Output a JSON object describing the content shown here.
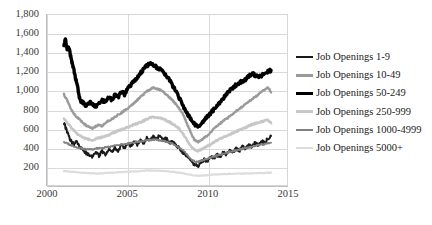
{
  "chart_data": {
    "type": "line",
    "title": "",
    "xlabel": "",
    "ylabel": "",
    "xlim": [
      2000,
      2015
    ],
    "ylim": [
      0,
      1800
    ],
    "ytick_labels": [
      "1,800",
      "1,600",
      "1,400",
      "1,200",
      "1,000",
      "800",
      "600",
      "400",
      "200",
      "-"
    ],
    "ytick_values": [
      1800,
      1600,
      1400,
      1200,
      1000,
      800,
      600,
      400,
      200,
      0
    ],
    "xtick_labels": [
      "2000",
      "2005",
      "2010",
      "2015"
    ],
    "xtick_values": [
      2000,
      2005,
      2010,
      2015
    ],
    "grid": "horizontal-and-vertical",
    "legend_position": "right",
    "series": [
      {
        "name": "Job Openings 1-9",
        "color": "#1a1a1a",
        "width": 2.0,
        "x": [
          2001.0,
          2001.2,
          2001.4,
          2001.6,
          2001.8,
          2002.0,
          2002.2,
          2002.4,
          2002.6,
          2002.8,
          2003.0,
          2003.2,
          2003.4,
          2003.6,
          2003.8,
          2004.0,
          2004.2,
          2004.4,
          2004.6,
          2004.8,
          2005.0,
          2005.2,
          2005.4,
          2005.6,
          2005.8,
          2006.0,
          2006.2,
          2006.4,
          2006.6,
          2006.8,
          2007.0,
          2007.2,
          2007.4,
          2007.6,
          2007.8,
          2008.0,
          2008.2,
          2008.4,
          2008.6,
          2008.8,
          2009.0,
          2009.2,
          2009.4,
          2009.6,
          2009.8,
          2010.0,
          2010.2,
          2010.4,
          2010.6,
          2010.8,
          2011.0,
          2011.2,
          2011.4,
          2011.6,
          2011.8,
          2012.0,
          2012.2,
          2012.4,
          2012.6,
          2012.8,
          2013.0,
          2013.2,
          2013.4,
          2013.6,
          2013.8,
          2014.0
        ],
        "values": [
          660,
          560,
          480,
          430,
          455,
          400,
          370,
          335,
          320,
          300,
          345,
          310,
          355,
          325,
          380,
          350,
          395,
          360,
          420,
          390,
          445,
          410,
          455,
          430,
          480,
          445,
          495,
          470,
          510,
          480,
          530,
          470,
          500,
          440,
          465,
          420,
          400,
          355,
          330,
          290,
          250,
          215,
          200,
          235,
          270,
          250,
          300,
          280,
          320,
          300,
          345,
          320,
          370,
          340,
          395,
          360,
          405,
          380,
          430,
          400,
          450,
          420,
          470,
          440,
          495,
          520
        ]
      },
      {
        "name": "Job Openings 10-49",
        "color": "#9a9a9a",
        "width": 2.4,
        "x": [
          2001.0,
          2001.2,
          2001.4,
          2001.6,
          2001.8,
          2002.0,
          2002.2,
          2002.4,
          2002.6,
          2002.8,
          2003.0,
          2003.2,
          2003.4,
          2003.6,
          2003.8,
          2004.0,
          2004.2,
          2004.4,
          2004.6,
          2004.8,
          2005.0,
          2005.2,
          2005.4,
          2005.6,
          2005.8,
          2006.0,
          2006.2,
          2006.4,
          2006.6,
          2006.8,
          2007.0,
          2007.2,
          2007.4,
          2007.6,
          2007.8,
          2008.0,
          2008.2,
          2008.4,
          2008.6,
          2008.8,
          2009.0,
          2009.2,
          2009.4,
          2009.6,
          2009.8,
          2010.0,
          2010.2,
          2010.4,
          2010.6,
          2010.8,
          2011.0,
          2011.2,
          2011.4,
          2011.6,
          2011.8,
          2012.0,
          2012.2,
          2012.4,
          2012.6,
          2012.8,
          2013.0,
          2013.2,
          2013.4,
          2013.6,
          2013.8,
          2014.0
        ],
        "values": [
          960,
          900,
          820,
          760,
          720,
          690,
          655,
          630,
          610,
          600,
          620,
          640,
          625,
          660,
          680,
          700,
          720,
          745,
          760,
          790,
          810,
          840,
          870,
          900,
          930,
          960,
          990,
          1010,
          1030,
          1020,
          1010,
          990,
          960,
          930,
          900,
          860,
          820,
          770,
          700,
          620,
          540,
          480,
          455,
          470,
          500,
          520,
          560,
          590,
          620,
          650,
          680,
          700,
          730,
          750,
          780,
          810,
          830,
          860,
          880,
          910,
          930,
          960,
          990,
          1010,
          1040,
          980
        ]
      },
      {
        "name": "Job Openings 50-249",
        "color": "#000000",
        "width": 3.4,
        "x": [
          2001.0,
          2001.1,
          2001.2,
          2001.3,
          2001.4,
          2001.5,
          2001.6,
          2001.7,
          2001.8,
          2001.9,
          2002.0,
          2002.2,
          2002.4,
          2002.6,
          2002.8,
          2003.0,
          2003.2,
          2003.4,
          2003.6,
          2003.8,
          2004.0,
          2004.2,
          2004.4,
          2004.6,
          2004.8,
          2005.0,
          2005.2,
          2005.4,
          2005.6,
          2005.8,
          2006.0,
          2006.2,
          2006.4,
          2006.6,
          2006.8,
          2007.0,
          2007.2,
          2007.4,
          2007.6,
          2007.8,
          2008.0,
          2008.2,
          2008.4,
          2008.6,
          2008.8,
          2009.0,
          2009.2,
          2009.4,
          2009.6,
          2009.8,
          2010.0,
          2010.2,
          2010.4,
          2010.6,
          2010.8,
          2011.0,
          2011.2,
          2011.4,
          2011.6,
          2011.8,
          2012.0,
          2012.2,
          2012.4,
          2012.6,
          2012.8,
          2013.0,
          2013.2,
          2013.4,
          2013.6,
          2013.8,
          2014.0
        ],
        "values": [
          1480,
          1550,
          1420,
          1460,
          1380,
          1300,
          1240,
          1150,
          1080,
          1000,
          900,
          870,
          840,
          880,
          860,
          830,
          870,
          900,
          870,
          930,
          900,
          950,
          930,
          990,
          960,
          1020,
          1060,
          1100,
          1140,
          1180,
          1230,
          1260,
          1290,
          1270,
          1250,
          1230,
          1200,
          1160,
          1120,
          1060,
          1000,
          930,
          870,
          800,
          740,
          690,
          640,
          620,
          650,
          690,
          720,
          760,
          800,
          840,
          880,
          920,
          960,
          1000,
          1030,
          1060,
          1080,
          1100,
          1120,
          1150,
          1180,
          1160,
          1140,
          1160,
          1180,
          1200,
          1215
        ]
      },
      {
        "name": "Job Openings 250-999",
        "color": "#c7c7c7",
        "width": 2.6,
        "x": [
          2001.0,
          2001.2,
          2001.4,
          2001.6,
          2001.8,
          2002.0,
          2002.2,
          2002.4,
          2002.6,
          2002.8,
          2003.0,
          2003.2,
          2003.4,
          2003.6,
          2003.8,
          2004.0,
          2004.2,
          2004.4,
          2004.6,
          2004.8,
          2005.0,
          2005.2,
          2005.4,
          2005.6,
          2005.8,
          2006.0,
          2006.2,
          2006.4,
          2006.6,
          2006.8,
          2007.0,
          2007.2,
          2007.4,
          2007.6,
          2007.8,
          2008.0,
          2008.2,
          2008.4,
          2008.6,
          2008.8,
          2009.0,
          2009.2,
          2009.4,
          2009.6,
          2009.8,
          2010.0,
          2010.2,
          2010.4,
          2010.6,
          2010.8,
          2011.0,
          2011.2,
          2011.4,
          2011.6,
          2011.8,
          2012.0,
          2012.2,
          2012.4,
          2012.6,
          2012.8,
          2013.0,
          2013.2,
          2013.4,
          2013.6,
          2013.8,
          2014.0
        ],
        "values": [
          700,
          660,
          620,
          580,
          545,
          520,
          500,
          490,
          480,
          475,
          490,
          500,
          505,
          520,
          530,
          545,
          560,
          575,
          585,
          600,
          610,
          625,
          640,
          650,
          665,
          680,
          700,
          710,
          720,
          715,
          710,
          700,
          685,
          670,
          650,
          625,
          600,
          560,
          510,
          450,
          400,
          370,
          360,
          375,
          395,
          410,
          430,
          450,
          470,
          490,
          505,
          520,
          535,
          550,
          565,
          580,
          595,
          610,
          625,
          640,
          650,
          660,
          670,
          680,
          690,
          655
        ]
      },
      {
        "name": "Job Openings 1000-4999",
        "color": "#808080",
        "width": 1.8,
        "x": [
          2001.0,
          2001.2,
          2001.4,
          2001.6,
          2001.8,
          2002.0,
          2002.2,
          2002.4,
          2002.6,
          2002.8,
          2003.0,
          2003.2,
          2003.4,
          2003.6,
          2003.8,
          2004.0,
          2004.2,
          2004.4,
          2004.6,
          2004.8,
          2005.0,
          2005.2,
          2005.4,
          2005.6,
          2005.8,
          2006.0,
          2006.2,
          2006.4,
          2006.6,
          2006.8,
          2007.0,
          2007.2,
          2007.4,
          2007.6,
          2007.8,
          2008.0,
          2008.2,
          2008.4,
          2008.6,
          2008.8,
          2009.0,
          2009.2,
          2009.4,
          2009.6,
          2009.8,
          2010.0,
          2010.2,
          2010.4,
          2010.6,
          2010.8,
          2011.0,
          2011.2,
          2011.4,
          2011.6,
          2011.8,
          2012.0,
          2012.2,
          2012.4,
          2012.6,
          2012.8,
          2013.0,
          2013.2,
          2013.4,
          2013.6,
          2013.8,
          2014.0
        ],
        "values": [
          455,
          440,
          425,
          410,
          400,
          390,
          385,
          380,
          378,
          375,
          385,
          390,
          392,
          398,
          402,
          408,
          415,
          420,
          425,
          432,
          438,
          445,
          452,
          458,
          462,
          468,
          474,
          478,
          480,
          478,
          474,
          468,
          460,
          450,
          438,
          420,
          400,
          375,
          345,
          310,
          270,
          250,
          245,
          255,
          268,
          278,
          290,
          300,
          312,
          322,
          332,
          342,
          350,
          358,
          366,
          374,
          382,
          390,
          398,
          406,
          414,
          422,
          428,
          434,
          440,
          448
        ]
      },
      {
        "name": "Job Openings 5000+",
        "color": "#dcdcdc",
        "width": 2.2,
        "x": [
          2001.0,
          2001.4,
          2001.8,
          2002.2,
          2002.6,
          2003.0,
          2003.4,
          2003.8,
          2004.2,
          2004.6,
          2005.0,
          2005.4,
          2005.8,
          2006.2,
          2006.6,
          2007.0,
          2007.4,
          2007.8,
          2008.2,
          2008.6,
          2009.0,
          2009.4,
          2009.8,
          2010.2,
          2010.6,
          2011.0,
          2011.4,
          2011.8,
          2012.2,
          2012.6,
          2013.0,
          2013.4,
          2013.8,
          2014.0
        ],
        "values": [
          148,
          142,
          136,
          130,
          126,
          122,
          124,
          128,
          132,
          136,
          140,
          144,
          148,
          152,
          154,
          150,
          146,
          140,
          132,
          120,
          106,
          98,
          102,
          108,
          112,
          116,
          118,
          120,
          122,
          124,
          126,
          128,
          130,
          132
        ]
      }
    ]
  },
  "legend": {
    "items": [
      {
        "label": "Job Openings 1-9",
        "color": "#1a1a1a",
        "thickness": "2.6px"
      },
      {
        "label": "Job Openings 10-49",
        "color": "#9a9a9a",
        "thickness": "2.6px"
      },
      {
        "label": "Job Openings 50-249",
        "color": "#000000",
        "thickness": "3.4px"
      },
      {
        "label": "Job Openings 250-999",
        "color": "#c7c7c7",
        "thickness": "2.6px"
      },
      {
        "label": "Job Openings 1000-4999",
        "color": "#808080",
        "thickness": "2.0px"
      },
      {
        "label": "Job Openings 5000+",
        "color": "#dcdcdc",
        "thickness": "2.2px"
      }
    ]
  }
}
